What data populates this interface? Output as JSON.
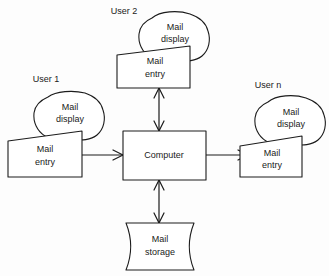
{
  "diagram": {
    "type": "block-diagram",
    "background_color": "#fdfdfd",
    "line_color": "#1c1c1c",
    "shape_fill": "#ffffff",
    "nodes": {
      "computer": {
        "label": "Computer",
        "shape": "rectangle"
      },
      "storage": {
        "label_line1": "Mail",
        "label_line2": "storage",
        "shape": "data-store"
      },
      "user1": {
        "caption": "User 1",
        "display_line1": "Mail",
        "display_line2": "display",
        "entry_line1": "Mail",
        "entry_line2": "entry"
      },
      "user2": {
        "caption": "User 2",
        "display_line1": "Mail",
        "display_line2": "display",
        "entry_line1": "Mail",
        "entry_line2": "entry"
      },
      "usern": {
        "caption": "User n",
        "display_line1": "Mail",
        "display_line2": "display",
        "entry_line1": "Mail",
        "entry_line2": "entry"
      }
    },
    "connectors": [
      {
        "name": "user1-to-computer",
        "from": "user1-mail-entry",
        "to": "computer",
        "direction": "one-way",
        "orientation": "horizontal"
      },
      {
        "name": "computer-to-usern",
        "from": "computer",
        "to": "usern-mail-entry",
        "direction": "one-way",
        "orientation": "horizontal"
      },
      {
        "name": "computer-user2",
        "from": "computer",
        "to": "user2-mail-entry",
        "direction": "two-way",
        "orientation": "vertical"
      },
      {
        "name": "computer-storage",
        "from": "computer",
        "to": "storage",
        "direction": "two-way",
        "orientation": "vertical"
      }
    ]
  }
}
